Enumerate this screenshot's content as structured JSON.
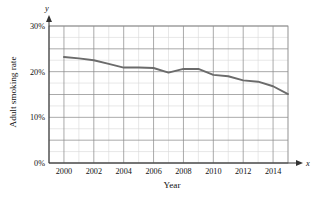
{
  "chart_data": {
    "type": "line",
    "title": "",
    "subtitle": "",
    "xlabel": "Year",
    "ylabel": "Adult smoking rate",
    "x_axis_name": "x",
    "y_axis_name": "y",
    "xlim": [
      1999,
      2015
    ],
    "ylim": [
      0,
      30
    ],
    "grid": true,
    "legend": "none",
    "x_tick_labels": [
      "2000",
      "2002",
      "2004",
      "2006",
      "2008",
      "2010",
      "2012",
      "2014"
    ],
    "x_tick_values": [
      2000,
      2002,
      2004,
      2006,
      2008,
      2010,
      2012,
      2014
    ],
    "y_tick_labels": [
      "0%",
      "10%",
      "20%",
      "30%"
    ],
    "y_tick_values": [
      0,
      10,
      20,
      30
    ],
    "x_minor_step": 1,
    "y_minor_step": 2.5,
    "series": [
      {
        "name": "Adult smoking rate",
        "color": "#6b6b6b",
        "x": [
          2000,
          2001,
          2002,
          2003,
          2004,
          2005,
          2006,
          2007,
          2008,
          2009,
          2010,
          2011,
          2012,
          2013,
          2014,
          2015
        ],
        "values": [
          23.2,
          22.9,
          22.5,
          21.7,
          20.9,
          20.9,
          20.8,
          19.8,
          20.6,
          20.6,
          19.3,
          19.0,
          18.1,
          17.8,
          16.8,
          15.1
        ]
      }
    ]
  },
  "labels": {
    "x_axis_title": "Year",
    "y_axis_title": "Adult smoking rate",
    "x_axis_variable": "x",
    "y_axis_variable": "y"
  }
}
